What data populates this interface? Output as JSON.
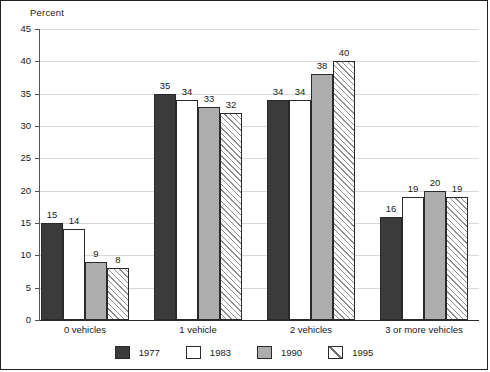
{
  "chart_data": {
    "type": "bar",
    "title": "",
    "xlabel": "",
    "ylabel": "Percent",
    "ylim": [
      0,
      45
    ],
    "ytick_step": 5,
    "yticks": [
      "0",
      "5",
      "10",
      "15",
      "20",
      "25",
      "30",
      "35",
      "40",
      "45"
    ],
    "grid": true,
    "legend_position": "bottom",
    "categories": [
      "0 vehicles",
      "1 vehicle",
      "2 vehicles",
      "3 or more vehicles"
    ],
    "series": [
      {
        "name": "1977",
        "color": "#3b3b3b",
        "pattern": "solid-dark",
        "values": [
          15,
          35,
          34,
          16
        ]
      },
      {
        "name": "1983",
        "color": "#ffffff",
        "pattern": "solid-white",
        "values": [
          14,
          34,
          34,
          19
        ]
      },
      {
        "name": "1990",
        "color": "#adadad",
        "pattern": "solid-gray",
        "values": [
          9,
          33,
          38,
          20
        ]
      },
      {
        "name": "1995",
        "color": "#ffffff",
        "pattern": "diagonal-hatch",
        "values": [
          8,
          32,
          40,
          19
        ]
      }
    ]
  },
  "axis": {
    "ylabel_text": "Percent"
  },
  "legend": {
    "items": [
      {
        "label": "1977"
      },
      {
        "label": "1983"
      },
      {
        "label": "1990"
      },
      {
        "label": "1995"
      }
    ]
  }
}
